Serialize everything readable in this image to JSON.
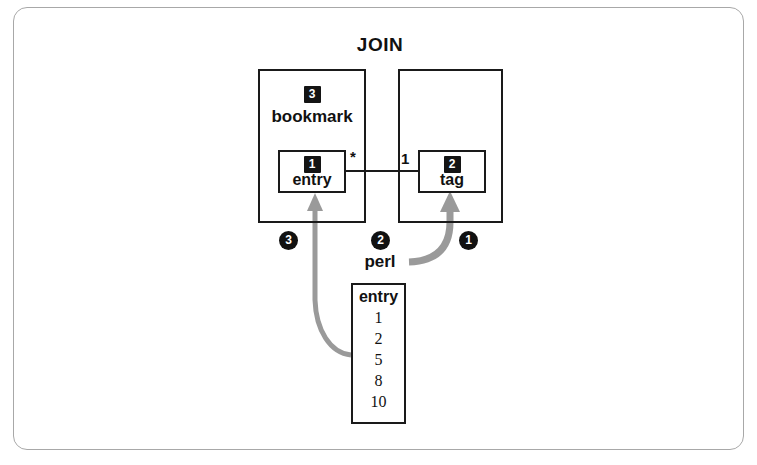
{
  "figure": {
    "title": "JOIN",
    "border_color": "#a8a8a8",
    "line_color": "#1a1a1a",
    "arrow_color": "#999999",
    "badge_color": "#111111"
  },
  "entities": {
    "bookmark": {
      "badge": "3",
      "label": "bookmark",
      "inner": {
        "badge": "1",
        "label": "entry"
      },
      "multiplicity": "*"
    },
    "tag_owner": {
      "badge": "",
      "label": "",
      "inner": {
        "badge": "2",
        "label": "tag"
      },
      "multiplicity": "1"
    }
  },
  "steps": [
    {
      "id": "step-1",
      "marker": "1"
    },
    {
      "id": "step-2",
      "marker": "2"
    },
    {
      "id": "step-3",
      "marker": "3"
    }
  ],
  "process_label": "perl",
  "result_table": {
    "header": "entry",
    "rows": [
      "1",
      "2",
      "5",
      "8",
      "10"
    ]
  }
}
